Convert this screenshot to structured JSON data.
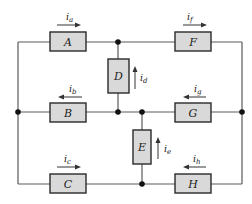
{
  "diagram": {
    "type": "circuit",
    "elements": [
      {
        "id": "A",
        "label": "A",
        "branch": "top-left"
      },
      {
        "id": "F",
        "label": "F",
        "branch": "top-right"
      },
      {
        "id": "B",
        "label": "B",
        "branch": "middle-left"
      },
      {
        "id": "G",
        "label": "G",
        "branch": "middle-right"
      },
      {
        "id": "C",
        "label": "C",
        "branch": "bottom-left"
      },
      {
        "id": "H",
        "label": "H",
        "branch": "bottom-right"
      },
      {
        "id": "D",
        "label": "D",
        "branch": "vertical-upper"
      },
      {
        "id": "E",
        "label": "E",
        "branch": "vertical-lower"
      }
    ],
    "currents": {
      "a": {
        "base": "i",
        "sub": "a",
        "direction": "right"
      },
      "f": {
        "base": "i",
        "sub": "f",
        "direction": "right"
      },
      "b": {
        "base": "i",
        "sub": "b",
        "direction": "left"
      },
      "g": {
        "base": "i",
        "sub": "g",
        "direction": "left"
      },
      "c": {
        "base": "i",
        "sub": "c",
        "direction": "right"
      },
      "h": {
        "base": "i",
        "sub": "h",
        "direction": "left"
      },
      "d": {
        "base": "i",
        "sub": "d",
        "direction": "up"
      },
      "e": {
        "base": "i",
        "sub": "e",
        "direction": "up"
      }
    }
  }
}
